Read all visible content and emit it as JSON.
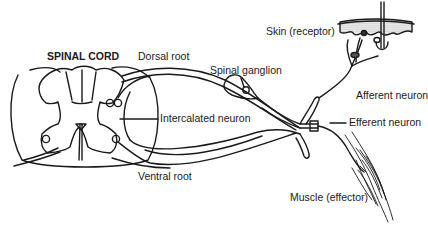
{
  "diagram": {
    "type": "reflex-arc-anatomy",
    "labels": {
      "spinal_cord": "SPINAL CORD",
      "dorsal_root": "Dorsal root",
      "spinal_ganglion": "Spinal ganglion",
      "skin_receptor": "Skin (receptor)",
      "afferent_neuron": "Afferent neuron",
      "intercalated_neuron": "Intercalated neuron",
      "efferent_neuron": "Efferent neuron",
      "ventral_root": "Ventral root",
      "muscle_effector": "Muscle (effector)"
    },
    "colors": {
      "line": "#1a1a1a",
      "background": "#ffffff",
      "skin_shading": "#9a9a9a"
    }
  }
}
